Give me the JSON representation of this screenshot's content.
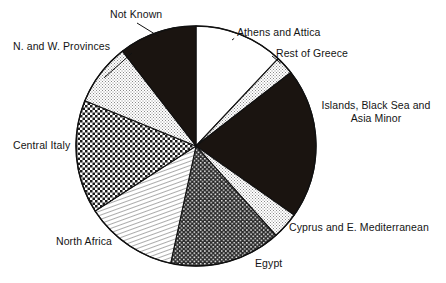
{
  "chart_data": {
    "type": "pie",
    "title": "",
    "subtitle": "",
    "xlabel": "",
    "ylabel": "",
    "legend_position": "none",
    "grid": false,
    "start_angle_deg": 0,
    "direction": "clockwise",
    "categories": [
      "Athens and Attica",
      "Rest of Greece",
      "Islands, Black Sea and Asia Minor",
      "Cyprus and E. Mediterranean",
      "Egypt",
      "North Africa",
      "Central Italy",
      "N. and W. Provinces",
      "Not Known"
    ],
    "values": [
      12.0,
      2.5,
      20.3,
      3.6,
      15.0,
      12.5,
      15.3,
      8.3,
      10.5
    ],
    "slices": [
      {
        "label": "Athens and Attica",
        "label_lines": [
          "Athens and Attica"
        ],
        "value": 12.0,
        "start_deg": 0,
        "end_deg": 43.2,
        "fill": "#ffffff",
        "pattern": "solid-white",
        "leader": true
      },
      {
        "label": "Rest of Greece",
        "label_lines": [
          "Rest of Greece"
        ],
        "value": 2.5,
        "start_deg": 43.2,
        "end_deg": 52.2,
        "fill": "#e8e8e8",
        "pattern": "fine-stipple",
        "leader": true
      },
      {
        "label": "Islands, Black Sea and Asia Minor",
        "label_lines": [
          "Islands, Black Sea and",
          "Asia Minor"
        ],
        "value": 20.3,
        "start_deg": 52.2,
        "end_deg": 125.2,
        "fill": "#1a1410",
        "pattern": "solid-black",
        "leader": false
      },
      {
        "label": "Cyprus and E. Mediterranean",
        "label_lines": [
          "Cyprus and E. Mediterranean"
        ],
        "value": 3.6,
        "start_deg": 125.2,
        "end_deg": 138.2,
        "fill": "#e8e8e8",
        "pattern": "fine-stipple",
        "leader": false
      },
      {
        "label": "Egypt",
        "label_lines": [
          "Egypt"
        ],
        "value": 15.0,
        "start_deg": 138.2,
        "end_deg": 192.2,
        "fill": "#3a3a3a",
        "pattern": "dark-checker",
        "leader": false
      },
      {
        "label": "North Africa",
        "label_lines": [
          "North Africa"
        ],
        "value": 12.5,
        "start_deg": 192.2,
        "end_deg": 237.2,
        "fill": "#f0f0f0",
        "pattern": "diagonal-hatch",
        "leader": false
      },
      {
        "label": "Central Italy",
        "label_lines": [
          "Central Italy"
        ],
        "value": 15.3,
        "start_deg": 237.2,
        "end_deg": 292.2,
        "fill": "#9a9a9a",
        "pattern": "mid-checker",
        "leader": false
      },
      {
        "label": "N. and W. Provinces",
        "label_lines": [
          "N. and W. Provinces"
        ],
        "value": 8.3,
        "start_deg": 292.2,
        "end_deg": 322.2,
        "fill": "#ececec",
        "pattern": "fine-stipple",
        "leader": true
      },
      {
        "label": "Not Known",
        "label_lines": [
          "Not Known"
        ],
        "value": 10.5,
        "start_deg": 322.2,
        "end_deg": 360,
        "fill": "#1a1410",
        "pattern": "solid-black",
        "leader": true
      }
    ],
    "geometry": {
      "center_x": 196,
      "center_y": 146,
      "radius": 120
    },
    "colors": {
      "outline": "#111111",
      "black_fill": "#1a1410",
      "white_fill": "#ffffff",
      "text": "#141414"
    }
  },
  "labels": {
    "athens": "Athens and Attica",
    "rest_of_greece": "Rest of Greece",
    "islands_line1": "Islands, Black Sea and",
    "islands_line2": "Asia Minor",
    "cyprus": "Cyprus and E. Mediterranean",
    "egypt": "Egypt",
    "north_africa": "North Africa",
    "central_italy": "Central Italy",
    "nw_provinces": "N. and W. Provinces",
    "not_known": "Not Known"
  }
}
